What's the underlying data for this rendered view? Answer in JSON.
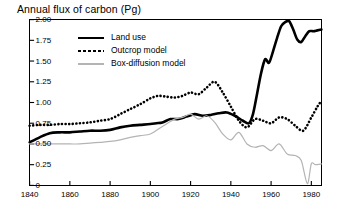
{
  "title": "Annual flux of carbon (Pg)",
  "legend": {
    "items": [
      {
        "label": "Land use",
        "style": "solid",
        "color": "#000000"
      },
      {
        "label": "Outcrop model",
        "style": "dotted",
        "color": "#000000"
      },
      {
        "label": "Box-diffusion model",
        "style": "solid-thin",
        "color": "#b4b4b4"
      }
    ]
  },
  "chart_data": {
    "type": "line",
    "title": "Annual flux of carbon (Pg)",
    "xlabel": "",
    "ylabel": "",
    "xlim": [
      1840,
      1985
    ],
    "ylim": [
      0,
      2.0
    ],
    "grid": false,
    "legend_position": "top-left-inside",
    "xticks": [
      1840,
      1860,
      1880,
      1900,
      1920,
      1940,
      1960,
      1980
    ],
    "yticks": [
      0,
      0.25,
      0.5,
      0.75,
      1.0,
      1.25,
      1.5,
      1.75,
      2.0
    ],
    "ytick_labels": [
      "0",
      "0.25",
      "0.50",
      "0.75",
      "1.00",
      "1.25",
      "1.50",
      "1.75",
      "2.00"
    ],
    "series": [
      {
        "name": "Land use",
        "color": "#000000",
        "style": "solid",
        "width": 2.6,
        "x": [
          1840,
          1845,
          1850,
          1855,
          1860,
          1865,
          1870,
          1875,
          1880,
          1885,
          1890,
          1895,
          1900,
          1903,
          1906,
          1910,
          1914,
          1918,
          1922,
          1926,
          1930,
          1934,
          1938,
          1942,
          1946,
          1949,
          1951,
          1953,
          1955,
          1957,
          1959,
          1961,
          1963,
          1965,
          1967,
          1969,
          1971,
          1973,
          1975,
          1977,
          1979,
          1981,
          1983,
          1985
        ],
        "y": [
          0.52,
          0.58,
          0.63,
          0.64,
          0.64,
          0.65,
          0.66,
          0.66,
          0.67,
          0.7,
          0.72,
          0.73,
          0.74,
          0.75,
          0.76,
          0.8,
          0.8,
          0.83,
          0.86,
          0.84,
          0.85,
          0.87,
          0.88,
          0.84,
          0.78,
          0.75,
          0.86,
          1.1,
          1.35,
          1.52,
          1.48,
          1.62,
          1.78,
          1.92,
          1.97,
          1.98,
          1.88,
          1.76,
          1.73,
          1.8,
          1.86,
          1.86,
          1.87,
          1.88
        ]
      },
      {
        "name": "Outcrop model",
        "color": "#000000",
        "style": "dotted",
        "width": 2.2,
        "x": [
          1840,
          1845,
          1850,
          1855,
          1860,
          1865,
          1870,
          1875,
          1880,
          1885,
          1890,
          1895,
          1900,
          1904,
          1908,
          1912,
          1916,
          1920,
          1924,
          1928,
          1932,
          1936,
          1940,
          1944,
          1948,
          1952,
          1956,
          1960,
          1964,
          1968,
          1972,
          1976,
          1980,
          1983,
          1985
        ],
        "y": [
          0.72,
          0.73,
          0.73,
          0.74,
          0.74,
          0.75,
          0.76,
          0.78,
          0.8,
          0.86,
          0.92,
          0.98,
          1.05,
          1.08,
          1.07,
          1.06,
          1.08,
          1.12,
          1.1,
          1.18,
          1.25,
          1.12,
          0.95,
          0.78,
          0.7,
          0.8,
          0.78,
          0.75,
          0.82,
          0.8,
          0.72,
          0.66,
          0.82,
          0.95,
          1.02
        ]
      },
      {
        "name": "Box-diffusion model",
        "color": "#b4b4b4",
        "style": "solid",
        "width": 1.2,
        "x": [
          1840,
          1845,
          1850,
          1855,
          1860,
          1865,
          1870,
          1875,
          1880,
          1885,
          1890,
          1895,
          1900,
          1904,
          1908,
          1912,
          1916,
          1920,
          1924,
          1928,
          1932,
          1936,
          1940,
          1944,
          1948,
          1952,
          1956,
          1960,
          1964,
          1968,
          1972,
          1975,
          1978,
          1980,
          1982,
          1985
        ],
        "y": [
          0.5,
          0.5,
          0.5,
          0.5,
          0.5,
          0.5,
          0.51,
          0.52,
          0.53,
          0.55,
          0.58,
          0.6,
          0.62,
          0.68,
          0.74,
          0.8,
          0.82,
          0.86,
          0.8,
          0.84,
          0.76,
          0.62,
          0.55,
          0.64,
          0.5,
          0.46,
          0.48,
          0.42,
          0.5,
          0.38,
          0.36,
          0.3,
          0.02,
          0.26,
          0.25,
          0.26
        ]
      }
    ]
  }
}
